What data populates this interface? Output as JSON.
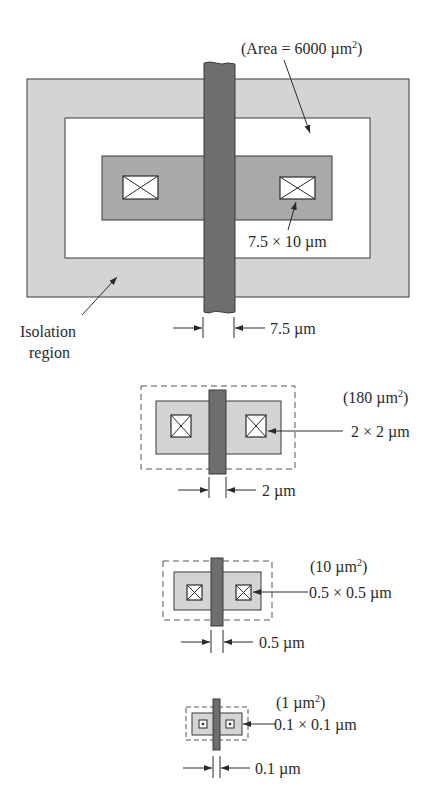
{
  "colors": {
    "isolation": "#d4d4d4",
    "active": "#a9a9a9",
    "gate": "#6e6e6e",
    "outline": "#3a3a3a",
    "white": "#ffffff"
  },
  "transistor_1": {
    "area_label": "(Area = 6000 µm",
    "area_sup": "2",
    "area_close": ")",
    "contact_label": "7.5 × 10 µm",
    "gate_label": "7.5 µm",
    "isolation_label_line1": "Isolation",
    "isolation_label_line2": "region"
  },
  "transistor_2": {
    "area_label": "(180 µm",
    "area_sup": "2",
    "area_close": ")",
    "contact_label": "2 × 2 µm",
    "gate_label": "2 µm"
  },
  "transistor_3": {
    "area_label": "(10 µm",
    "area_sup": "2",
    "area_close": ")",
    "contact_label": "0.5 × 0.5 µm",
    "gate_label": "0.5 µm"
  },
  "transistor_4": {
    "area_label": "(1 µm",
    "area_sup": "2",
    "area_close": ")",
    "contact_label": "0.1 × 0.1 µm",
    "gate_label": "0.1 µm"
  }
}
